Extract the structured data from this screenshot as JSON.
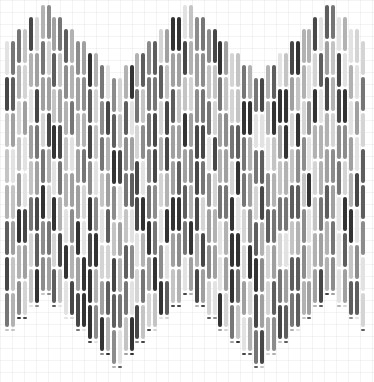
{
  "artwork": {
    "description": "Generative pattern of vertical grayscale segmented bars forming a zigzag band over a faint grid",
    "canvas": {
      "width": 374,
      "height": 382,
      "background": "#ffffff",
      "grid_color": "#f2f2f2",
      "grid_size": 12
    },
    "columns": {
      "count": 61,
      "x_start": 5,
      "pitch": 5.93,
      "bar_width": 4,
      "pairs_share_height": true
    },
    "zigzag": {
      "peak_top_y": 5,
      "trough_top_y": 78,
      "step_per_pair": 12,
      "pair_tops": [
        41,
        29,
        17,
        5,
        17,
        29,
        41,
        53,
        65,
        78,
        65,
        53,
        41,
        29,
        17,
        5,
        17,
        29,
        41,
        53,
        65,
        78,
        65,
        53,
        41,
        29,
        17,
        5,
        17,
        29,
        41
      ],
      "band_height": 292,
      "bottom_limit": 374
    },
    "segments": {
      "height": 36,
      "gap": 2,
      "palette": [
        "#e2e2e2",
        "#d4d4d4",
        "#c4c4c4",
        "#b2b2b2",
        "#a0a0a0",
        "#8c8c8c",
        "#767676",
        "#5e5e5e",
        "#474747",
        "#333333"
      ]
    }
  }
}
